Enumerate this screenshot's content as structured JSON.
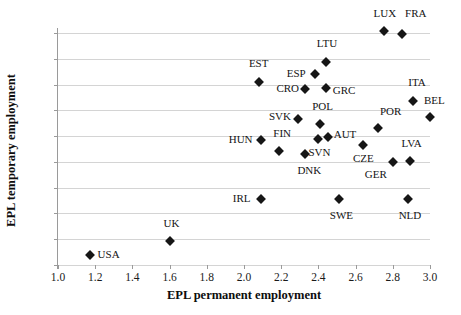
{
  "chart_data": {
    "type": "scatter",
    "title": "",
    "xlabel": "EPL permanent employment",
    "ylabel": "EPL temporary employment",
    "xlim": [
      1.0,
      3.0
    ],
    "ylim": [
      0.2,
      3.8
    ],
    "xticks": [
      "1.0",
      "1.2",
      "1.4",
      "1.6",
      "1.8",
      "2.0",
      "2.2",
      "2.4",
      "2.6",
      "2.8",
      "3.0"
    ],
    "yticks": [
      "0.2",
      "0.6",
      "1.0",
      "1.4",
      "1.8",
      "2.2",
      "2.6",
      "3.0",
      "3.4",
      "3.8"
    ],
    "grid": "horizontal",
    "legend": "none",
    "marker": "diamond",
    "marker_color": "#161616",
    "grid_color": "#d4d4d4",
    "points": [
      {
        "label": "USA",
        "x": 1.17,
        "y": 0.35,
        "lx": 8,
        "ly": -3
      },
      {
        "label": "UK",
        "x": 1.6,
        "y": 0.57,
        "lx": -6,
        "ly": -20
      },
      {
        "label": "IRL",
        "x": 2.09,
        "y": 1.22,
        "lx": -28,
        "ly": -3
      },
      {
        "label": "SWE",
        "x": 2.51,
        "y": 1.22,
        "lx": -9,
        "ly": 14
      },
      {
        "label": "NLD",
        "x": 2.88,
        "y": 1.22,
        "lx": -9,
        "ly": 14
      },
      {
        "label": "DNK",
        "x": 2.33,
        "y": 1.92,
        "lx": -8,
        "ly": 14
      },
      {
        "label": "GER",
        "x": 2.8,
        "y": 1.8,
        "lx": -28,
        "ly": 10
      },
      {
        "label": "LVA",
        "x": 2.89,
        "y": 1.81,
        "lx": -8,
        "ly": -20
      },
      {
        "label": "FIN",
        "x": 2.19,
        "y": 1.97,
        "lx": -6,
        "ly": -20
      },
      {
        "label": "HUN",
        "x": 2.09,
        "y": 2.14,
        "lx": -32,
        "ly": -3
      },
      {
        "label": "SVN",
        "x": 2.4,
        "y": 2.16,
        "lx": -10,
        "ly": 11
      },
      {
        "label": "AUT",
        "x": 2.45,
        "y": 2.19,
        "lx": 6,
        "ly": -5
      },
      {
        "label": "CZE",
        "x": 2.64,
        "y": 2.06,
        "lx": -10,
        "ly": 11
      },
      {
        "label": "POL",
        "x": 2.41,
        "y": 2.39,
        "lx": -8,
        "ly": -20
      },
      {
        "label": "POR",
        "x": 2.72,
        "y": 2.33,
        "lx": 2,
        "ly": -19
      },
      {
        "label": "SVK",
        "x": 2.29,
        "y": 2.47,
        "lx": -29,
        "ly": -5
      },
      {
        "label": "BEL",
        "x": 3.0,
        "y": 2.5,
        "lx": -6,
        "ly": -19
      },
      {
        "label": "ITA",
        "x": 2.91,
        "y": 2.75,
        "lx": -5,
        "ly": -21
      },
      {
        "label": "CRO",
        "x": 2.33,
        "y": 2.93,
        "lx": -29,
        "ly": -3
      },
      {
        "label": "GRC",
        "x": 2.44,
        "y": 2.95,
        "lx": 7,
        "ly": 0
      },
      {
        "label": "EST",
        "x": 2.08,
        "y": 3.04,
        "lx": -10,
        "ly": -21
      },
      {
        "label": "ESP",
        "x": 2.38,
        "y": 3.17,
        "lx": -28,
        "ly": -3
      },
      {
        "label": "LTU",
        "x": 2.44,
        "y": 3.35,
        "lx": -9,
        "ly": -21
      },
      {
        "label": "LUX",
        "x": 2.75,
        "y": 3.83,
        "lx": -10,
        "ly": -20
      },
      {
        "label": "FRA",
        "x": 2.85,
        "y": 3.78,
        "lx": 3,
        "ly": -23
      }
    ]
  }
}
